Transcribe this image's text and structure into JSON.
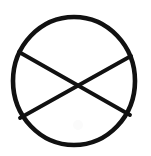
{
  "figure": {
    "name": "circle-with-crossed-chords",
    "background_color": "#ffffff",
    "stroke_color": "#111111",
    "canvas": {
      "width": 151,
      "height": 156
    },
    "circle": {
      "name": "outer-circle",
      "center_x": 74,
      "center_y": 81,
      "radius_x": 61,
      "radius_y": 64,
      "stroke_width": 4.6
    },
    "chords": [
      {
        "name": "chord-upper-left-to-lower-right",
        "x1": 19,
        "y1": 52,
        "x2": 130,
        "y2": 115,
        "stroke_width": 3.8
      },
      {
        "name": "chord-upper-right-to-lower-left",
        "x1": 131,
        "y1": 56,
        "x2": 20,
        "y2": 118,
        "stroke_width": 3.8
      }
    ],
    "crossing_point": {
      "name": "chord-intersection",
      "x": 75,
      "y": 85
    },
    "smudge": {
      "name": "faint-pencil-smudge",
      "x": 78,
      "y": 125,
      "radius": 5,
      "color": "#fbfbfb"
    },
    "caption": ""
  }
}
